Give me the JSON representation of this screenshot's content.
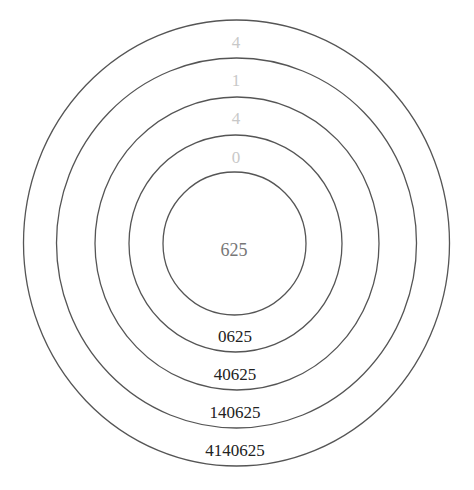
{
  "diagram": {
    "center_label": "625",
    "top_digits": [
      "4",
      "1",
      "4",
      "0"
    ],
    "bottom_labels": [
      "0625",
      "40625",
      "140625",
      "4140625"
    ],
    "colors": {
      "ring_stroke": "#555555",
      "faint_digit": "#c8c8c8",
      "center_text": "#777777",
      "bottom_text": "#222222"
    }
  }
}
